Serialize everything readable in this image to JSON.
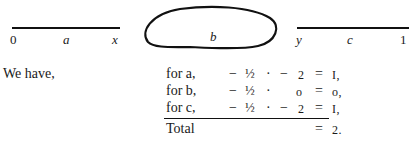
{
  "diagram": {
    "left_segment": {
      "start_label": "0",
      "mid_label": "a",
      "end_label": "x"
    },
    "blob": {
      "label": "b"
    },
    "right_segment": {
      "start_label": "y",
      "mid_label": "c",
      "end_label": "1"
    }
  },
  "text": {
    "intro": "We have,",
    "rows": [
      {
        "label": "for a,",
        "minus": "−",
        "half": "½",
        "dot": "·",
        "sign": "−",
        "value": "2",
        "eq": "=",
        "result": "I,"
      },
      {
        "label": "for b,",
        "minus": "−",
        "half": "½",
        "dot": "·",
        "sign": "",
        "value": "o",
        "eq": "=",
        "result": "o,"
      },
      {
        "label": "for c,",
        "minus": "−",
        "half": "½",
        "dot": "·",
        "sign": "−",
        "value": "2",
        "eq": "=",
        "result": "I,"
      }
    ],
    "total": {
      "label": "Total",
      "eq": "=",
      "result": "2."
    }
  }
}
